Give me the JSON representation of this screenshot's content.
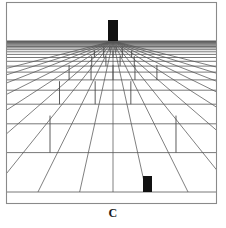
{
  "figure": {
    "caption": "C",
    "kind": "perspective-grid-illustration",
    "background_color": "#ffffff",
    "line_color": "#555555",
    "frame_color": "#8a8a8a",
    "object_color": "#111111",
    "width": 226,
    "height": 228
  },
  "frame": {
    "left": 6.5,
    "top": 2.5,
    "right": 216.5,
    "bottom": 203.5,
    "stroke_width": 1.1
  },
  "scene": {
    "vanishing_point": {
      "x": 113,
      "y": 41
    },
    "horizon_y": 41,
    "ground_top_y": 41,
    "ground_bottom_y": 192
  },
  "chart_data": {
    "type": "line",
    "title": "C",
    "xlabel": "",
    "ylabel": "",
    "depth_lines_y": [
      41.0,
      41.6,
      42.3,
      43.1,
      44.0,
      45.1,
      46.4,
      47.9,
      49.7,
      51.8,
      54.4,
      57.5,
      61.3,
      66.1,
      72.1,
      79.9,
      90.2,
      104.2,
      123.8,
      152.6,
      192.0
    ],
    "radiating_lines_x_at_bottom": [
      -520,
      -400,
      -300,
      -212,
      -138,
      -74,
      -18,
      32,
      77,
      113,
      149,
      194,
      244,
      302,
      368,
      444,
      532,
      636,
      760
    ],
    "poles": [
      {
        "row": 9,
        "col": -3,
        "height_px": 5
      },
      {
        "row": 9,
        "col": -1,
        "height_px": 5
      },
      {
        "row": 9,
        "col": 1,
        "height_px": 5
      },
      {
        "row": 9,
        "col": 3,
        "height_px": 5
      },
      {
        "row": 11,
        "col": -4,
        "height_px": 7
      },
      {
        "row": 11,
        "col": -2,
        "height_px": 7
      },
      {
        "row": 11,
        "col": 0,
        "height_px": 7
      },
      {
        "row": 11,
        "col": 2,
        "height_px": 7
      },
      {
        "row": 11,
        "col": 4,
        "height_px": 7
      },
      {
        "row": 13,
        "col": -3,
        "height_px": 10
      },
      {
        "row": 13,
        "col": -1,
        "height_px": 10
      },
      {
        "row": 13,
        "col": 1,
        "height_px": 10
      },
      {
        "row": 13,
        "col": 3,
        "height_px": 10
      },
      {
        "row": 15,
        "col": -4,
        "height_px": 15
      },
      {
        "row": 15,
        "col": -2,
        "height_px": 15
      },
      {
        "row": 15,
        "col": 0,
        "height_px": 15
      },
      {
        "row": 15,
        "col": 2,
        "height_px": 15
      },
      {
        "row": 15,
        "col": 4,
        "height_px": 15
      },
      {
        "row": 17,
        "col": -3,
        "height_px": 23
      },
      {
        "row": 17,
        "col": -1,
        "height_px": 23
      },
      {
        "row": 17,
        "col": 1,
        "height_px": 23
      },
      {
        "row": 19,
        "col": -4,
        "height_px": 37
      },
      {
        "row": 19,
        "col": -2,
        "height_px": 37
      },
      {
        "row": 19,
        "col": 2,
        "height_px": 37
      }
    ]
  },
  "objects": {
    "far_tower": {
      "label": "far-tower",
      "x": 108,
      "y": 20,
      "width": 10,
      "height": 21,
      "color": "#111111"
    },
    "near_block": {
      "label": "near-block",
      "x": 143,
      "y": 176,
      "width": 9,
      "height": 16,
      "color": "#111111"
    }
  }
}
